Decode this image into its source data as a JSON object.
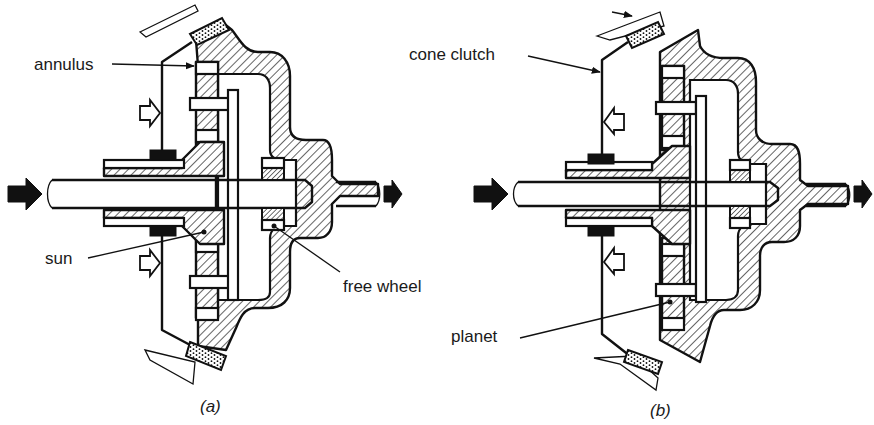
{
  "figure": {
    "panels": [
      {
        "id": "a",
        "caption": "(a)",
        "labels": {
          "annulus": "annulus",
          "sun": "sun",
          "free_wheel": "free wheel"
        }
      },
      {
        "id": "b",
        "caption": "(b)",
        "labels": {
          "cone_clutch": "cone clutch",
          "planet": "planet"
        }
      }
    ],
    "colors": {
      "ink": "#111111",
      "background": "#ffffff"
    }
  }
}
